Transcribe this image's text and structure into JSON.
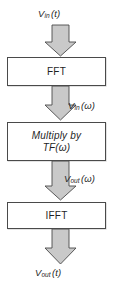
{
  "diagram": {
    "type": "flowchart",
    "orientation": "vertical",
    "background_color": "#ffffff",
    "box_fill_color": "#ffffff",
    "box_border_color": "#4a4a4a",
    "arrow_fill_color": "#c9c9c9",
    "arrow_border_color": "#4a4a4a",
    "text_color": "#1f1f1f"
  },
  "labels": {
    "input_time": {
      "symbol": "V",
      "subscript": "in",
      "argument": "(t)"
    },
    "input_freq": {
      "symbol": "V",
      "subscript": "in",
      "argument": "(ω)"
    },
    "output_freq": {
      "symbol": "V",
      "subscript": "out",
      "argument": "(ω)"
    },
    "output_time": {
      "symbol": "V",
      "subscript": "out",
      "argument": "(t)"
    }
  },
  "blocks": [
    {
      "id": "fft",
      "label": "FFT",
      "italic": false
    },
    {
      "id": "mult",
      "label_line1": "Multiply by",
      "label_line2_symbol": "TF",
      "label_line2_argument": "(ω)",
      "italic": true
    },
    {
      "id": "ifft",
      "label": "IFFT",
      "italic": false
    }
  ],
  "arrows": [
    {
      "id": "arrow-1",
      "from": "input_time",
      "to": "fft"
    },
    {
      "id": "arrow-2",
      "from": "fft",
      "to": "mult"
    },
    {
      "id": "arrow-3",
      "from": "mult",
      "to": "ifft"
    },
    {
      "id": "arrow-4",
      "from": "ifft",
      "to": "output_time"
    }
  ]
}
